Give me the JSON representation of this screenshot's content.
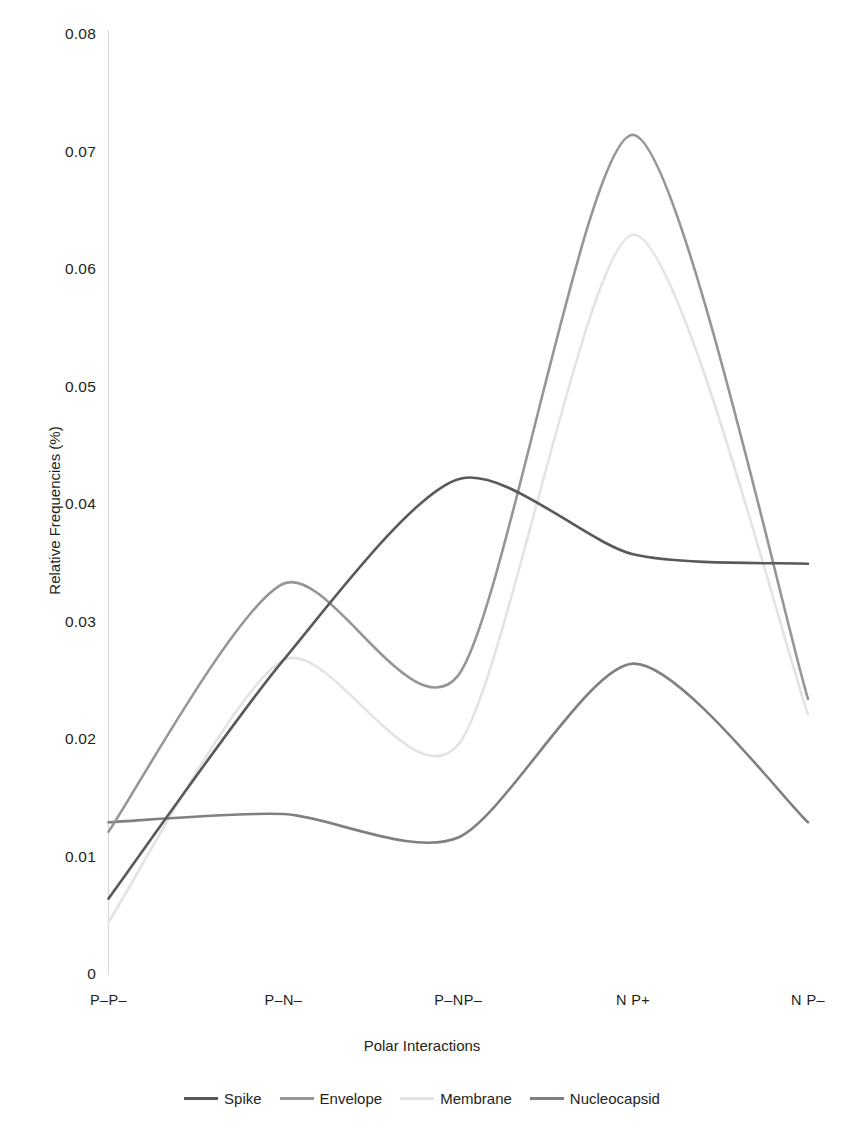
{
  "chart_data": {
    "type": "line",
    "title": "",
    "xlabel": "Polar Interactions",
    "ylabel": "Relative Frequencies (%)",
    "categories": [
      "P–P–",
      "P–N–",
      "P–NP–",
      "N P+",
      "N P–"
    ],
    "yticks": [
      "0",
      "0.01",
      "0.02",
      "0.03",
      "0.04",
      "0.05",
      "0.06",
      "0.07",
      "0.08"
    ],
    "ytick_values": [
      0,
      0.01,
      0.02,
      0.03,
      0.04,
      0.05,
      0.06,
      0.07,
      0.08
    ],
    "ylim": [
      0,
      0.08
    ],
    "grid": false,
    "legend_position": "bottom",
    "smoothing": "spline",
    "series": [
      {
        "name": "Spike",
        "color": "#58595b",
        "values": [
          0.0065,
          0.0268,
          0.0422,
          0.0358,
          0.035
        ]
      },
      {
        "name": "Envelope",
        "color": "#949699",
        "values": [
          0.0122,
          0.0333,
          0.0255,
          0.0715,
          0.0235
        ]
      },
      {
        "name": "Membrane",
        "color": "#e2e3e4",
        "values": [
          0.0045,
          0.0268,
          0.0196,
          0.063,
          0.0222
        ]
      },
      {
        "name": "Nucleocapsid",
        "color": "#7e8083",
        "values": [
          0.013,
          0.0137,
          0.0117,
          0.0265,
          0.013
        ]
      }
    ]
  },
  "legend": {
    "items": [
      {
        "label": "Spike",
        "color": "#58595b"
      },
      {
        "label": "Envelope",
        "color": "#949699"
      },
      {
        "label": "Membrane",
        "color": "#e2e3e4"
      },
      {
        "label": "Nucleocapsid",
        "color": "#7e8083"
      }
    ]
  },
  "axes": {
    "y_title": "Relative Frequencies (%)",
    "x_title": "Polar Interactions"
  }
}
